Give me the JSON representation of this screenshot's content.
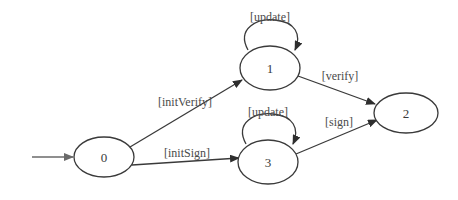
{
  "diagram": {
    "type": "state-machine",
    "colors": {
      "stroke": "#3a3a3a",
      "text": "#4a4a4a",
      "background": "#ffffff"
    },
    "nodes": [
      {
        "id": "0",
        "label": "0",
        "cx": 104,
        "cy": 157,
        "rx": 30,
        "ry": 20,
        "initial": true
      },
      {
        "id": "1",
        "label": "1",
        "cx": 270,
        "cy": 68,
        "rx": 30,
        "ry": 22
      },
      {
        "id": "2",
        "label": "2",
        "cx": 406,
        "cy": 113,
        "rx": 32,
        "ry": 20
      },
      {
        "id": "3",
        "label": "3",
        "cx": 268,
        "cy": 162,
        "rx": 30,
        "ry": 22
      }
    ],
    "edges": [
      {
        "from": "start",
        "to": "0",
        "label": ""
      },
      {
        "from": "0",
        "to": "1",
        "label": "[initVerify]"
      },
      {
        "from": "0",
        "to": "3",
        "label": "[initSign]"
      },
      {
        "from": "1",
        "to": "1",
        "label": "[update]"
      },
      {
        "from": "3",
        "to": "3",
        "label": "[update]"
      },
      {
        "from": "1",
        "to": "2",
        "label": "[verify]"
      },
      {
        "from": "3",
        "to": "2",
        "label": "[sign]"
      }
    ]
  }
}
